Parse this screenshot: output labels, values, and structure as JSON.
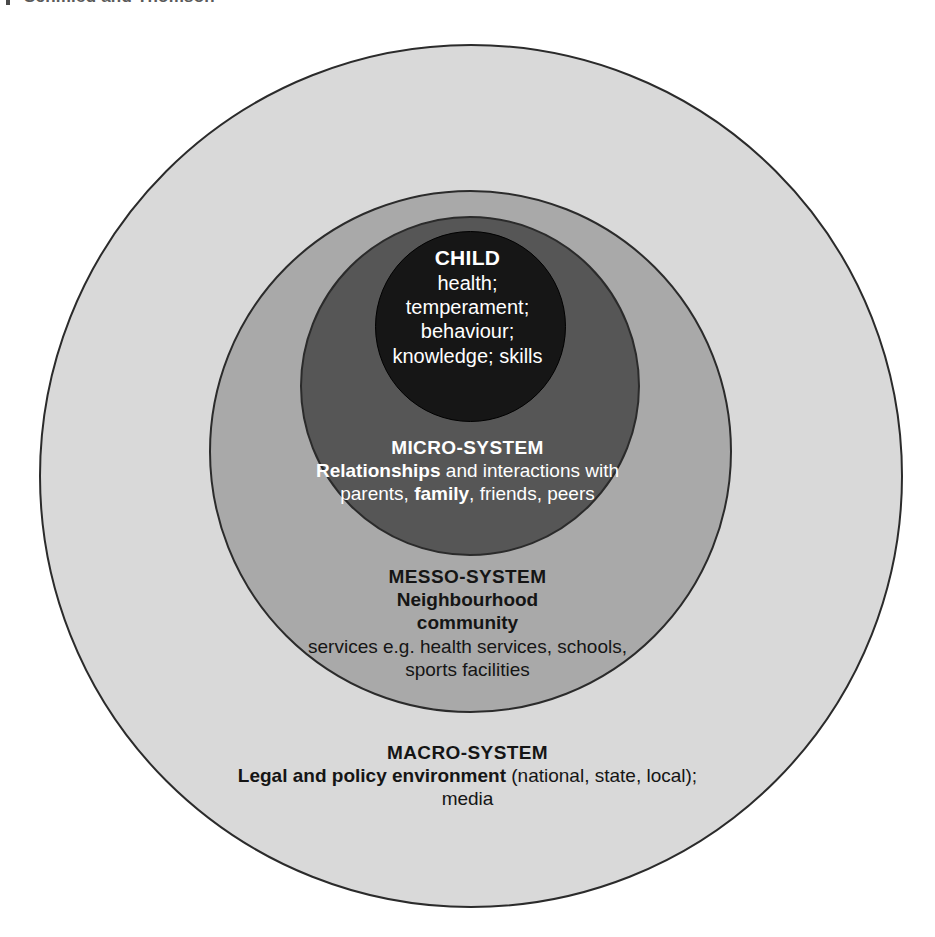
{
  "page": {
    "header_remnant": "Schmied and Thomson"
  },
  "diagram": {
    "type": "concentric-circles",
    "layers": [
      {
        "id": "macro",
        "name": "MACRO-SYSTEM",
        "fill": "#d9d9d9",
        "text_color": "#151515",
        "order": 1
      },
      {
        "id": "messo",
        "name": "MESSO-SYSTEM",
        "fill": "#a9a9a9",
        "text_color": "#151515",
        "order": 2
      },
      {
        "id": "micro",
        "name": "MICRO-SYSTEM",
        "fill": "#565656",
        "text_color": "#ffffff",
        "order": 3
      },
      {
        "id": "child",
        "name": "CHILD",
        "fill": "#161616",
        "text_color": "#ffffff",
        "order": 4
      }
    ],
    "child": {
      "title": "CHILD",
      "lines": [
        "health;",
        "temperament;",
        "behaviour;",
        "knowledge; skills"
      ]
    },
    "micro": {
      "title": "MICRO-SYSTEM",
      "line1_bold": "Relationships",
      "line1_rest": " and interactions with",
      "line2_pre": "parents, ",
      "line2_bold": "family",
      "line2_post": ", friends, peers"
    },
    "messo": {
      "title": "MESSO-SYSTEM",
      "subtitle_line1": "Neighbourhood",
      "subtitle_line2": "community",
      "detail_line1": "services e.g. health services, schools,",
      "detail_line2": "sports facilities"
    },
    "macro": {
      "title": "MACRO-SYSTEM",
      "line1_bold": "Legal and policy environment",
      "line1_rest": " (national, state, local);",
      "line2": "media"
    }
  }
}
